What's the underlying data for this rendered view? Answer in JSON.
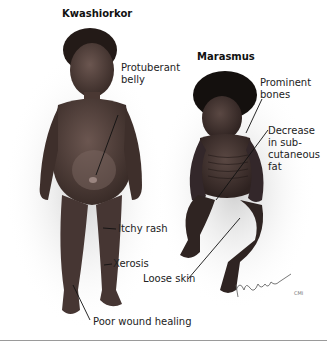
{
  "figure": {
    "left_title": "Kwashiorkor",
    "right_title": "Marasmus",
    "left_labels": {
      "protuberant_belly": "Protuberant belly",
      "itchy_rash": "Itchy rash",
      "xerosis": "Xerosis",
      "poor_wound_healing": "Poor wound healing"
    },
    "right_labels": {
      "prominent_bones": "Prominent bones",
      "decrease_fat": "Decrease in sub-cutaneous fat",
      "loose_skin": "Loose skin"
    },
    "label_lines": {
      "protuberant_1": "Protuberant",
      "protuberant_2": "belly",
      "prominent_1": "Prominent",
      "prominent_2": "bones",
      "decrease_1": "Decrease",
      "decrease_2": "in sub-",
      "decrease_3": "cutaneous",
      "decrease_4": "fat"
    },
    "signature_suffix": "CMI",
    "colors": {
      "skin": "#4a3a35",
      "shadow": "#d9d9d9",
      "hair": "#1a1412",
      "leader_line": "#111111"
    }
  }
}
